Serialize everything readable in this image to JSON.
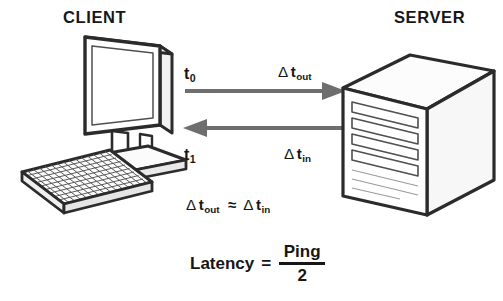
{
  "headings": {
    "client": "CLIENT",
    "server": "SERVER"
  },
  "timestamps": {
    "t0_base": "t",
    "t0_sub": "0",
    "t1_base": "t",
    "t1_sub": "1"
  },
  "arrows": {
    "outbound": {
      "delta": "Δ",
      "base": "t",
      "sub": "out",
      "direction": "right",
      "color": "#6e6e6e"
    },
    "inbound": {
      "delta": "Δ",
      "base": "t",
      "sub": "in",
      "direction": "left",
      "color": "#6e6e6e"
    }
  },
  "equations": {
    "approx": {
      "delta_left": "Δ",
      "left_base": "t",
      "left_sub": "out",
      "operator": "≈",
      "delta_right": "Δ",
      "right_base": "t",
      "right_sub": "in"
    },
    "latency": {
      "label": "Latency",
      "equals": "=",
      "numerator": "Ping",
      "denominator": "2"
    }
  },
  "illustrations": {
    "monitor": "desktop-monitor-isometric",
    "keyboard": "keyboard-isometric",
    "server": "server-tower-isometric",
    "server_slots": 4
  },
  "colors": {
    "background": "#ffffff",
    "outline": "#2b2b2b",
    "detail_line": "#4f4f4f",
    "arrow": "#6e6e6e",
    "text": "#161616"
  }
}
